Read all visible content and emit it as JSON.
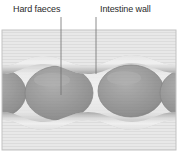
{
  "figure": {
    "labels": [
      {
        "id": "hard-faeces",
        "text": "Hard faeces",
        "x": 13,
        "y": 4,
        "leader": {
          "x": 61,
          "y1": 17,
          "y2": 95
        }
      },
      {
        "id": "intestine-wall",
        "text": "Intestine wall",
        "x": 100,
        "y": 4,
        "leader": {
          "x": 96,
          "y1": 17,
          "y2": 74
        }
      }
    ],
    "panel": {
      "x": 2,
      "y": 30,
      "width": 174,
      "height": 120
    },
    "colors": {
      "label_text": "#2b2b2b",
      "leader_line": "#6e6e6e",
      "panel_background": "#e6e6e6",
      "panel_border": "#c8c8c8",
      "scanline": "#d8d8d8",
      "wall_light": "#f2f2f2",
      "wall_mid": "#b9b9b9",
      "wall_dark": "#8f8f8f",
      "lumen_light": "#ededed",
      "faeces_fill": "#8e8e8e",
      "faeces_edge": "#6f6f6f",
      "faeces_highlight": "#a8a8a8"
    },
    "faeces_masses": [
      {
        "cx": -4,
        "cy": 93,
        "rx": 30,
        "ry": 25
      },
      {
        "cx": 59,
        "cy": 93,
        "rx": 34,
        "ry": 27
      },
      {
        "cx": 131,
        "cy": 91,
        "rx": 33,
        "ry": 26
      },
      {
        "cx": 188,
        "cy": 93,
        "rx": 28,
        "ry": 24
      }
    ]
  }
}
